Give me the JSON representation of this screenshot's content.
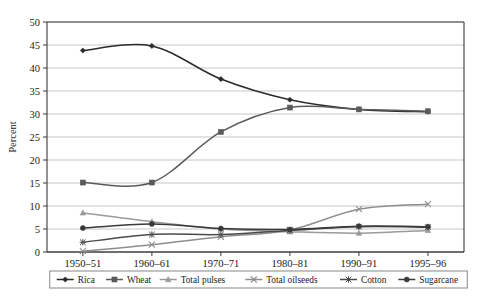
{
  "chart_data": {
    "type": "line",
    "title": "",
    "xlabel": "",
    "ylabel": "Percent",
    "categories": [
      "1950–51",
      "1960–61",
      "1970–71",
      "1980–81",
      "1990–91",
      "1995–96"
    ],
    "ylim": [
      0,
      50
    ],
    "ytick_step": 5,
    "yticks": [
      "0",
      "5",
      "10",
      "15",
      "20",
      "25",
      "30",
      "35",
      "40",
      "45",
      "50"
    ],
    "grid": "horizontal",
    "legend_position": "bottom",
    "series": [
      {
        "name": "Rica",
        "marker": "diamond",
        "color": "#2b2b2b",
        "values": [
          43.8,
          44.8,
          37.6,
          33.1,
          31.0,
          30.5
        ]
      },
      {
        "name": "Wheat",
        "marker": "square",
        "color": "#5a5a5a",
        "values": [
          15.1,
          15.1,
          26.1,
          31.4,
          31.0,
          30.6
        ]
      },
      {
        "name": "Total pulses",
        "marker": "triangle",
        "color": "#9a9a9a",
        "values": [
          8.5,
          6.6,
          5.0,
          4.4,
          4.1,
          4.7
        ]
      },
      {
        "name": "Total oilseeds",
        "marker": "cross",
        "color": "#8e8e8e",
        "values": [
          0.2,
          1.6,
          3.3,
          4.8,
          9.3,
          10.4
        ]
      },
      {
        "name": "Cotton",
        "marker": "asterisk",
        "color": "#4a4a4a",
        "values": [
          2.1,
          3.8,
          3.8,
          4.7,
          5.5,
          5.4
        ]
      },
      {
        "name": "Sugarcane",
        "marker": "circle",
        "color": "#3a3a3a",
        "values": [
          5.2,
          6.1,
          5.1,
          4.9,
          5.6,
          5.5
        ]
      }
    ]
  },
  "legend": {
    "items": [
      {
        "label": "Rica"
      },
      {
        "label": "Wheat"
      },
      {
        "label": "Total pulses"
      },
      {
        "label": "Total oilseeds"
      },
      {
        "label": "Cotton"
      },
      {
        "label": "Sugarcane"
      }
    ]
  }
}
